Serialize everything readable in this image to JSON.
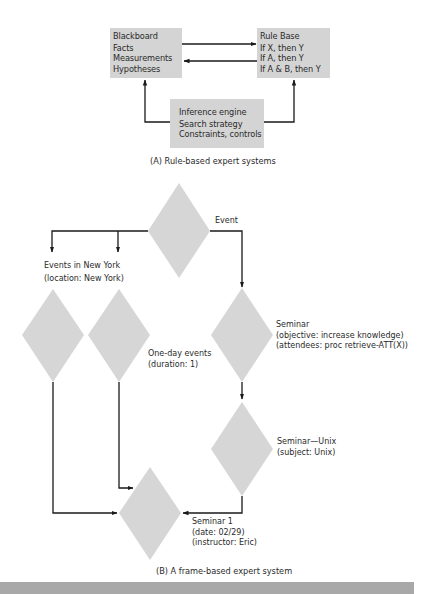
{
  "part_a": {
    "blackboard": {
      "title": "Blackboard",
      "items": [
        "Facts",
        "Measurements",
        "Hypotheses"
      ]
    },
    "rule_base": {
      "title": "Rule Base",
      "items": [
        "If X, then Y",
        "If A, then Y",
        "If A & B, then Y"
      ]
    },
    "inference_engine": {
      "title": "Inference engine",
      "items": [
        "Search strategy",
        "Constraints, controls"
      ]
    },
    "caption": "(A)  Rule-based expert systems"
  },
  "part_b": {
    "frames": {
      "event": {
        "label": [
          "Event"
        ]
      },
      "events_new_york": {
        "label": [
          "Events in New York",
          "(location:  New York)"
        ]
      },
      "one_day_events": {
        "label": [
          "One-day events",
          "(duration:  1)"
        ]
      },
      "seminar": {
        "label": [
          "Seminar",
          "(objective:  increase knowledge)",
          "(attendees:  proc retrieve-ATT(X))"
        ]
      },
      "seminar_unix": {
        "label": [
          "Seminar—Unix",
          "(subject:  Unix)"
        ]
      },
      "seminar_1": {
        "label": [
          "Seminar 1",
          "(date:  02/29)",
          "(instructor:  Eric)"
        ]
      }
    },
    "caption": "(B)  A frame-based expert system"
  },
  "colors": {
    "box_fill": "#d4d4d4",
    "diamond_fill": "#d6d6d6",
    "line": "#1a1a1a",
    "band": "#a8a8a8"
  }
}
